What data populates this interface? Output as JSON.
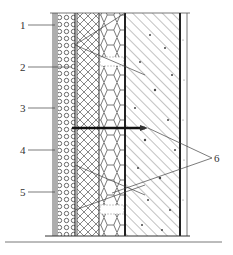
{
  "figure": {
    "type": "wall-section-detail",
    "colors": {
      "line": "#333333",
      "hatch": "#555555",
      "background": "#ffffff"
    },
    "layers": [
      {
        "id": "finish",
        "pattern": "thin-lines"
      },
      {
        "id": "mortar-mesh",
        "pattern": "circles"
      },
      {
        "id": "insulation-board",
        "pattern": "crosshatch"
      },
      {
        "id": "insulation-core",
        "pattern": "hexagon"
      },
      {
        "id": "concrete-wall",
        "pattern": "diagonal-hatch-aggregate"
      },
      {
        "id": "interior-plaster",
        "pattern": "dotted"
      }
    ],
    "labels": [
      {
        "id": "1",
        "text": "1"
      },
      {
        "id": "2",
        "text": "2"
      },
      {
        "id": "3",
        "text": "3"
      },
      {
        "id": "4",
        "text": "4"
      },
      {
        "id": "5",
        "text": "5"
      },
      {
        "id": "6",
        "text": "6"
      }
    ]
  }
}
